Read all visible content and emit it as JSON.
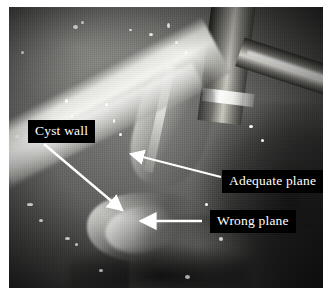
{
  "figure": {
    "type": "laparoscopic-surgical-photograph",
    "modality": "endoscopic still image",
    "color_mode": "grayscale",
    "border": "white page margin",
    "photo_rect_px": {
      "x": 9,
      "y": 7,
      "width": 314,
      "height": 281
    }
  },
  "annotations": {
    "labels": [
      {
        "id": "cyst-wall",
        "text": "Cyst wall",
        "box_px": {
          "x": 28,
          "y": 120,
          "width": 68,
          "height": 21
        },
        "text_color": "#ffffff",
        "box_color": "#000000",
        "arrow": {
          "from_px": {
            "x": 44,
            "y": 144
          },
          "to_px": {
            "x": 124,
            "y": 212
          },
          "direction": "down-right",
          "color": "#ffffff"
        }
      },
      {
        "id": "adequate-plane",
        "text": "Adequate plane",
        "box_px": {
          "x": 222,
          "y": 170,
          "width": 100,
          "height": 21
        },
        "text_color": "#ffffff",
        "box_color": "#000000",
        "arrow": {
          "from_px": {
            "x": 221,
            "y": 177
          },
          "to_px": {
            "x": 128,
            "y": 153
          },
          "direction": "up-left",
          "color": "#ffffff"
        }
      },
      {
        "id": "wrong-plane",
        "text": "Wrong plane",
        "box_px": {
          "x": 210,
          "y": 210,
          "width": 89,
          "height": 21
        },
        "text_color": "#ffffff",
        "box_color": "#000000",
        "arrow": {
          "from_px": {
            "x": 202,
            "y": 221
          },
          "to_px": {
            "x": 138,
            "y": 221
          },
          "direction": "left",
          "color": "#ffffff"
        }
      }
    ]
  },
  "scene": {
    "structures": [
      "cyst wall",
      "retracted tissue flap",
      "fibrous strands",
      "surrounding soft tissue"
    ],
    "instruments": [
      "vertical metallic laparoscopic instrument",
      "diagonal metallic laparoscopic instrument"
    ]
  }
}
